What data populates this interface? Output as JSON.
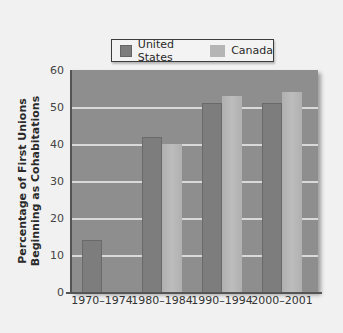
{
  "chart_data": {
    "type": "bar",
    "title": "",
    "xlabel": "",
    "ylabel": "Percentage of First Unions Beginning as Cohabitations",
    "ylabel_lines": [
      "Percentage of First Unions",
      "Beginning as Cohabitations"
    ],
    "categories": [
      "1970–1974",
      "1980–1984",
      "1990–1994",
      "2000–2001"
    ],
    "series": [
      {
        "name": "United States",
        "color": "#7d7d7d",
        "values": [
          14,
          42,
          51,
          51
        ]
      },
      {
        "name": "Canada",
        "color": "#b5b5b5",
        "values": [
          null,
          40,
          53,
          54
        ]
      }
    ],
    "ylim": [
      0,
      60
    ],
    "yticks": [
      0,
      10,
      20,
      30,
      40,
      50,
      60
    ],
    "grid": true,
    "legend_position": "top"
  },
  "legend": {
    "items": [
      {
        "label": "United States",
        "color": "#7d7d7d"
      },
      {
        "label": "Canada",
        "color": "#b5b5b5"
      }
    ]
  }
}
